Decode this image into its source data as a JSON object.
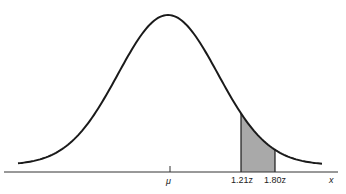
{
  "diagram": {
    "type": "normal-distribution-curve",
    "mean_label": "μ",
    "x_axis_label": "x",
    "shaded_region": {
      "lower_label": "1.21z",
      "upper_label": "1.80z",
      "lower_z": 1.21,
      "upper_z": 1.8,
      "fill_color": "#a9a9a9"
    },
    "curve_color": "#1a1a1a"
  }
}
